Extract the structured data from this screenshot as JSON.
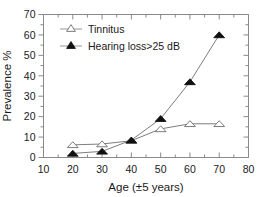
{
  "chart_data": {
    "type": "line",
    "title": "",
    "xlabel": "Age (±5 years)",
    "ylabel": "Prevalence %",
    "xlim": [
      10,
      80
    ],
    "ylim": [
      0,
      70
    ],
    "xticks": [
      10,
      20,
      30,
      40,
      50,
      60,
      70,
      80
    ],
    "yticks": [
      0,
      10,
      20,
      30,
      40,
      50,
      60,
      70
    ],
    "xtick_labels": [
      "10",
      "20",
      "30",
      "40",
      "50",
      "60",
      "70",
      "80"
    ],
    "ytick_labels": [
      "0",
      "10",
      "20",
      "30",
      "40",
      "50",
      "60",
      "70"
    ],
    "grid": false,
    "minor_ticks": true,
    "legend_position": "upper left inside",
    "x": [
      20,
      30,
      40,
      50,
      60,
      70
    ],
    "series": [
      {
        "name": "Tinnitus",
        "marker": "open-triangle",
        "marker_fill": "#ffffff",
        "marker_edge": "#6e6e6e",
        "line_color": "#6e6e6e",
        "values": [
          6.2,
          6.6,
          8.2,
          14.0,
          16.5,
          16.5
        ]
      },
      {
        "name": "Hearing loss>25 dB",
        "marker": "filled-triangle",
        "marker_fill": "#111111",
        "marker_edge": "#111111",
        "line_color": "#6e6e6e",
        "values": [
          2.0,
          3.0,
          8.5,
          19.0,
          37.0,
          60.0
        ]
      }
    ]
  },
  "legend": {
    "entries": [
      {
        "label": "Tinnitus"
      },
      {
        "label": "Hearing loss>25 dB"
      }
    ]
  },
  "colors": {
    "axis": "#8a8a8a",
    "text": "#1a1a1a",
    "line": "#6e6e6e",
    "filled_marker": "#111111",
    "open_marker": "#ffffff",
    "background": "#ffffff"
  }
}
